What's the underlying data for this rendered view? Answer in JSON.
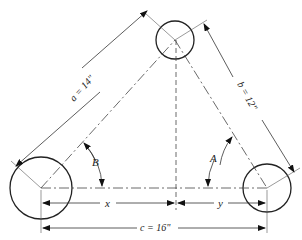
{
  "diagram": {
    "type": "engineering-dimension-drawing",
    "labels": {
      "side_a": "a = 14\"",
      "side_b": "b = 12\"",
      "side_c": "c = 16\"",
      "segment_x": "x",
      "segment_y": "y",
      "angle_A": "A",
      "angle_B": "B"
    },
    "circles": [
      {
        "name": "left-circle",
        "cx": 41,
        "cy": 188,
        "r": 31
      },
      {
        "name": "top-circle",
        "cx": 175,
        "cy": 40,
        "r": 19
      },
      {
        "name": "right-circle",
        "cx": 267,
        "cy": 188,
        "r": 24
      }
    ],
    "colors": {
      "line": "#333333",
      "background": "#ffffff"
    }
  }
}
